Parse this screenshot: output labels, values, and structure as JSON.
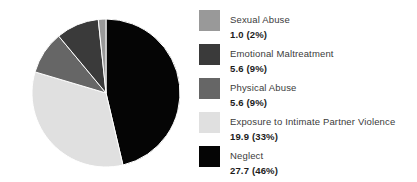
{
  "chart_data": {
    "type": "pie",
    "title": "",
    "subtitle": "",
    "xlabel": "",
    "ylabel": "",
    "legend_position": "right",
    "grid": false,
    "categories": [
      "Sexual Abuse",
      "Emotional Maltreatment",
      "Physical Abuse",
      "Exposure to Intimate Partner Violence",
      "Neglect"
    ],
    "values": [
      1.0,
      5.6,
      5.6,
      19.9,
      27.7
    ],
    "percentages": [
      2,
      9,
      9,
      33,
      46
    ],
    "value_labels": [
      "1.0 (2%)",
      "5.6 (9%)",
      "5.6 (9%)",
      "19.9 (33%)",
      "27.7 (46%)"
    ],
    "colors": [
      "#999999",
      "#3a3a3a",
      "#666666",
      "#e0e0e0",
      "#050505"
    ],
    "slices": [
      {
        "label": "Sexual Abuse",
        "value": 1.0,
        "percent": 2,
        "value_label": "1.0 (2%)",
        "color": "#999999"
      },
      {
        "label": "Emotional Maltreatment",
        "value": 5.6,
        "percent": 9,
        "value_label": "5.6 (9%)",
        "color": "#3a3a3a"
      },
      {
        "label": "Physical Abuse",
        "value": 5.6,
        "percent": 9,
        "value_label": "5.6 (9%)",
        "color": "#666666"
      },
      {
        "label": "Exposure to Intimate Partner Violence",
        "value": 19.9,
        "percent": 33,
        "value_label": "19.9 (33%)",
        "color": "#e0e0e0"
      },
      {
        "label": "Neglect",
        "value": 27.7,
        "percent": 46,
        "value_label": "27.7 (46%)",
        "color": "#050505"
      }
    ]
  },
  "legend": {
    "items": [
      {
        "label": "Sexual Abuse",
        "value_label": "1.0 (2%)",
        "color": "#999999"
      },
      {
        "label": "Emotional Maltreatment",
        "value_label": "5.6 (9%)",
        "color": "#3a3a3a"
      },
      {
        "label": "Physical Abuse",
        "value_label": "5.6 (9%)",
        "color": "#666666"
      },
      {
        "label": "Exposure to Intimate Partner Violence",
        "value_label": "19.9 (33%)",
        "color": "#e0e0e0"
      },
      {
        "label": "Neglect",
        "value_label": "27.7 (46%)",
        "color": "#050505"
      }
    ]
  },
  "canvas": {
    "background": "#ffffff",
    "pie_center_x": 106,
    "pie_center_y": 93,
    "pie_radius": 74
  }
}
